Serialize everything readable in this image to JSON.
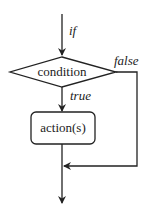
{
  "diagram": {
    "type": "flowchart",
    "colors": {
      "stroke": "#222222",
      "background": "#ffffff"
    },
    "nodes": {
      "condition": {
        "shape": "diamond",
        "label": "condition"
      },
      "action": {
        "shape": "rounded-rectangle",
        "label": "action(s)"
      }
    },
    "edges": {
      "entry": {
        "label": "if"
      },
      "true_branch": {
        "label": "true"
      },
      "false_branch": {
        "label": "false"
      }
    }
  }
}
